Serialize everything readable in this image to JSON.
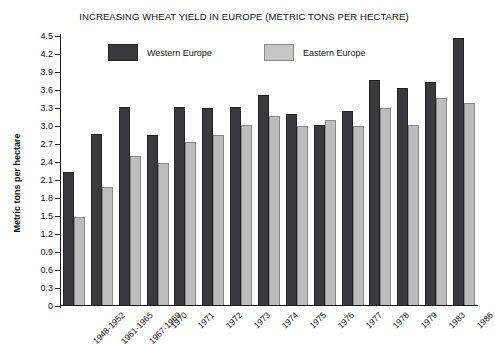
{
  "chart_data": {
    "type": "bar",
    "title": "INCREASING WHEAT YIELD IN EUROPE (METRIC TONS PER HECTARE)",
    "xlabel": "",
    "ylabel": "Metric tons per hectare",
    "ylim": [
      0,
      4.5
    ],
    "y_tick_step": 0.3,
    "y_ticks": [
      "0",
      "0.3",
      "0.6",
      "0.9",
      "1.2",
      "1.5",
      "1.8",
      "2.1",
      "2.4",
      "2.7",
      "3.0",
      "3.3",
      "3.6",
      "3.9",
      "4.2",
      "4.5"
    ],
    "grid": false,
    "legend_position": "top-inside",
    "categories": [
      "1948-1952",
      "1961-1965",
      "1967-1969",
      "1970",
      "1971",
      "1972",
      "1973",
      "1974",
      "1975",
      "1976",
      "1977",
      "1978",
      "1979",
      "1983",
      "1986"
    ],
    "series": [
      {
        "name": "Western Europe",
        "color": "#3a3a3c",
        "values": [
          2.22,
          2.85,
          3.3,
          2.83,
          3.3,
          3.28,
          3.3,
          3.5,
          3.18,
          3.0,
          3.23,
          3.75,
          3.62,
          3.72,
          4.45
        ]
      },
      {
        "name": "Eastern Europe",
        "color": "#bdbdbd",
        "values": [
          1.47,
          1.97,
          2.48,
          2.37,
          2.72,
          2.83,
          3.0,
          3.15,
          2.98,
          3.08,
          2.98,
          3.28,
          3.0,
          3.45,
          3.37
        ]
      }
    ]
  },
  "legend": {
    "items": [
      {
        "label": "Western Europe",
        "swatch": "west"
      },
      {
        "label": "Eastern Europe",
        "swatch": "east"
      }
    ]
  }
}
